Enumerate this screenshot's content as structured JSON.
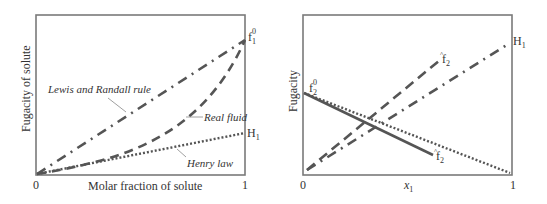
{
  "left_panel": {
    "ylabel": "Fugacity of solute",
    "xlabel": "Molar fraction of solute",
    "x_tick_start": "0",
    "x_tick_end": "1",
    "endpoint_top": {
      "base": "f",
      "sub": "1",
      "sup": "0"
    },
    "endpoint_mid": {
      "base": "H",
      "sub": "1"
    },
    "annotations": {
      "lewis_randall": "Lewis and Randall rule",
      "real_fluid": "Real fluid",
      "henry_law": "Henry law"
    }
  },
  "right_panel": {
    "ylabel": "Fugacity",
    "xlabel": {
      "base": "x",
      "sub": "1"
    },
    "x_tick_start": "0",
    "x_tick_end": "1",
    "label_f2_0": {
      "base": "f",
      "sub": "2",
      "sup": "0"
    },
    "label_f2hat_upper": {
      "base": "f",
      "sub": "2",
      "hat": "^"
    },
    "label_f2hat_lower": {
      "base": "f",
      "sub": "2",
      "hat": "^"
    },
    "label_H1": {
      "base": "H",
      "sub": "1"
    }
  },
  "colors": {
    "line": "#555555",
    "frame": "#777777",
    "text": "#333333"
  }
}
